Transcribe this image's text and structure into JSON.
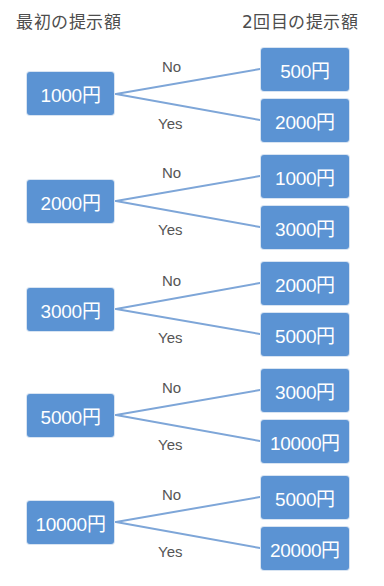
{
  "headers": {
    "first_offer": "最初の提示額",
    "second_offer": "2回目の提示額"
  },
  "edge_labels": {
    "no": "No",
    "yes": "Yes"
  },
  "colors": {
    "box_fill": "#5b93d3",
    "box_text": "#ffffff",
    "connector": "#7ea6d8",
    "label_text": "#555555"
  },
  "groups": [
    {
      "first": "1000円",
      "no_next": "500円",
      "yes_next": "2000円"
    },
    {
      "first": "2000円",
      "no_next": "1000円",
      "yes_next": "3000円"
    },
    {
      "first": "3000円",
      "no_next": "2000円",
      "yes_next": "5000円"
    },
    {
      "first": "5000円",
      "no_next": "3000円",
      "yes_next": "10000円"
    },
    {
      "first": "10000円",
      "no_next": "5000円",
      "yes_next": "20000円"
    }
  ]
}
